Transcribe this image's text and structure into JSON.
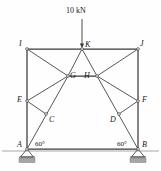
{
  "figure": {
    "type": "truss-free-body-diagram",
    "line_color": "#3a3a3a",
    "ground_hatch_color": "#9b9b9b",
    "base_plate_color": "#a6a6a6",
    "background": "#fefefe"
  },
  "load": {
    "label": "10 kN",
    "magnitude": 10,
    "unit": "kN",
    "direction": "down",
    "applied_at": "K",
    "arrow": {
      "x": 82,
      "y_start": 19,
      "y_end": 48
    },
    "text_pos": {
      "x": 66,
      "y": 7
    }
  },
  "angles": [
    {
      "label": "60°",
      "at_joint": "A",
      "x": 35,
      "y": 141
    },
    {
      "label": "60°",
      "at_joint": "B",
      "x": 117,
      "y": 141
    }
  ],
  "joints": [
    {
      "id": "A",
      "label": "A",
      "x": 27,
      "y": 149,
      "label_x": 17,
      "label_y": 141,
      "support": "pin"
    },
    {
      "id": "B",
      "label": "B",
      "x": 138,
      "y": 149,
      "label_x": 142,
      "label_y": 141,
      "support": "pin"
    },
    {
      "id": "C",
      "label": "C",
      "x": 46,
      "y": 114,
      "label_x": 49,
      "label_y": 116,
      "support": "none"
    },
    {
      "id": "D",
      "label": "D",
      "x": 119,
      "y": 114,
      "label_x": 110,
      "label_y": 116,
      "support": "none"
    },
    {
      "id": "E",
      "label": "E",
      "x": 27,
      "y": 101,
      "label_x": 17,
      "label_y": 96,
      "support": "none"
    },
    {
      "id": "F",
      "label": "F",
      "x": 138,
      "y": 101,
      "label_x": 142,
      "label_y": 96,
      "support": "none"
    },
    {
      "id": "G",
      "label": "G",
      "x": 68,
      "y": 76,
      "label_x": 70,
      "label_y": 72,
      "support": "none"
    },
    {
      "id": "H",
      "label": "H",
      "x": 97,
      "y": 76,
      "label_x": 84,
      "label_y": 72,
      "support": "none"
    },
    {
      "id": "I",
      "label": "I",
      "x": 27,
      "y": 49,
      "label_x": 19,
      "label_y": 40,
      "support": "none"
    },
    {
      "id": "J",
      "label": "J",
      "x": 138,
      "y": 49,
      "label_x": 140,
      "label_y": 40,
      "support": "none"
    },
    {
      "id": "K",
      "label": "K",
      "x": 82,
      "y": 49,
      "label_x": 85,
      "label_y": 41,
      "support": "none"
    }
  ],
  "members": [
    {
      "from": "A",
      "to": "I",
      "kind": "chord"
    },
    {
      "from": "B",
      "to": "J",
      "kind": "chord"
    },
    {
      "from": "I",
      "to": "K",
      "kind": "chord"
    },
    {
      "from": "K",
      "to": "J",
      "kind": "chord"
    },
    {
      "from": "A",
      "to": "B",
      "kind": "chord"
    },
    {
      "from": "A",
      "to": "G",
      "kind": "diagonal"
    },
    {
      "from": "B",
      "to": "H",
      "kind": "diagonal"
    },
    {
      "from": "I",
      "to": "G",
      "kind": "diagonal"
    },
    {
      "from": "J",
      "to": "H",
      "kind": "diagonal"
    },
    {
      "from": "E",
      "to": "G",
      "kind": "diagonal"
    },
    {
      "from": "F",
      "to": "H",
      "kind": "diagonal"
    },
    {
      "from": "E",
      "to": "C",
      "kind": "diagonal"
    },
    {
      "from": "F",
      "to": "D",
      "kind": "diagonal"
    },
    {
      "from": "G",
      "to": "K",
      "kind": "diagonal"
    },
    {
      "from": "H",
      "to": "K",
      "kind": "diagonal"
    },
    {
      "from": "G",
      "to": "H",
      "kind": "chord"
    }
  ],
  "supports": [
    {
      "at": "A",
      "type": "pin",
      "x": 27,
      "y": 149
    },
    {
      "at": "B",
      "type": "pin",
      "x": 138,
      "y": 149
    }
  ],
  "ground_line": {
    "x1": 2,
    "x2": 159,
    "y": 151
  }
}
